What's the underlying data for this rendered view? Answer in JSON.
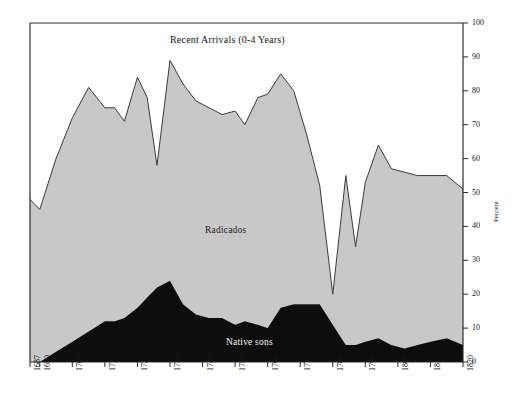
{
  "chart_data": {
    "type": "area",
    "stacked": true,
    "title": "Recent Arrivals (0-4 Years)",
    "xlabel": "",
    "ylabel": "Percent",
    "ylim": [
      0,
      100
    ],
    "xlim": [
      1687,
      1820
    ],
    "grid": false,
    "legend": "inline-labels",
    "yticks": [
      0,
      10,
      20,
      30,
      40,
      50,
      60,
      70,
      80,
      90,
      100
    ],
    "ytick_labels": [
      "0",
      "10",
      "20",
      "30",
      "40",
      "50",
      "60",
      "70",
      "80",
      "90",
      "100"
    ],
    "xticks": [
      1687,
      1690,
      1700,
      1710,
      1720,
      1730,
      1740,
      1750,
      1760,
      1770,
      1780,
      1790,
      1800,
      1810,
      1820
    ],
    "xtick_labels": [
      "1687",
      "1690",
      "1700",
      "1710",
      "1720",
      "1730",
      "1740",
      "1750",
      "1760",
      "1770",
      "1780",
      "1790",
      "1800",
      "1810",
      "1820"
    ],
    "annotations": [
      {
        "text": "Recent Arrivals (0-4 Years)",
        "x": 1722,
        "y": 95,
        "color": "#141414"
      },
      {
        "text": "Radicados",
        "x": 1733,
        "y": 40,
        "color": "#1c1c1c"
      },
      {
        "text": "Native sons",
        "x": 1743,
        "y": 7,
        "color": "#f2f2f2"
      }
    ],
    "colors": {
      "recent_arrivals": "#ffffff",
      "radicados": "#c8c8c8",
      "native_sons": "#0d0d0d",
      "axis": "#2a2a2a",
      "outline": "#3a3a3a"
    },
    "x": [
      1687,
      1690,
      1695,
      1700,
      1705,
      1710,
      1713,
      1716,
      1720,
      1723,
      1726,
      1730,
      1734,
      1738,
      1742,
      1746,
      1750,
      1753,
      1757,
      1760,
      1764,
      1768,
      1772,
      1776,
      1780,
      1784,
      1787,
      1790,
      1794,
      1798,
      1802,
      1806,
      1810,
      1815,
      1820
    ],
    "series": [
      {
        "name": "Native sons",
        "color": "#0d0d0d",
        "values": [
          0,
          0,
          3,
          6,
          9,
          12,
          12,
          13,
          16,
          19,
          22,
          24,
          17,
          14,
          13,
          13,
          11,
          12,
          11,
          10,
          16,
          17,
          17,
          17,
          11,
          5,
          5,
          6,
          7,
          5,
          4,
          5,
          6,
          7,
          5
        ]
      },
      {
        "name": "Radicados",
        "color": "#c8c8c8",
        "values": [
          48,
          45,
          57,
          66,
          72,
          63,
          63,
          58,
          68,
          59,
          36,
          65,
          65,
          63,
          62,
          60,
          63,
          58,
          67,
          69,
          69,
          63,
          50,
          35,
          9,
          50,
          29,
          47,
          57,
          52,
          52,
          50,
          49,
          48,
          46
        ]
      },
      {
        "name": "Recent Arrivals (0-4 Years)",
        "color": "#ffffff",
        "values": [
          52,
          55,
          40,
          28,
          19,
          25,
          25,
          29,
          16,
          22,
          42,
          11,
          18,
          23,
          25,
          27,
          26,
          30,
          22,
          21,
          15,
          20,
          33,
          48,
          80,
          45,
          66,
          47,
          36,
          43,
          44,
          45,
          45,
          45,
          49
        ]
      }
    ],
    "cumulative_top_of_radicados": [
      48,
      45,
      60,
      72,
      81,
      75,
      75,
      71,
      84,
      78,
      58,
      89,
      82,
      77,
      75,
      73,
      74,
      70,
      78,
      79,
      85,
      80,
      67,
      52,
      20,
      55,
      34,
      53,
      64,
      57,
      56,
      55,
      55,
      55,
      51
    ]
  },
  "chart_meta": {
    "title": "Recent Arrivals (0-4 Years)",
    "y_axis_title": "Percent",
    "label_radicados": "Radicados",
    "label_native_sons": "Native sons"
  }
}
